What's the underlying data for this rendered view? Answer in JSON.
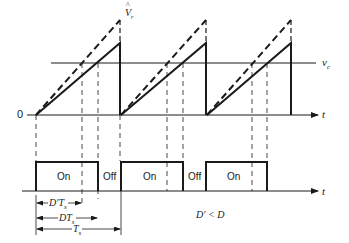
{
  "diagram": {
    "type": "pwm-waveform",
    "colors": {
      "stroke": "#1a1a1a",
      "background": "#ffffff"
    },
    "top_plot": {
      "origin_label": "0",
      "time_axis_label": "t",
      "control_voltage_label": "v_c",
      "peak_label_hat": "^",
      "peak_label": "V_r",
      "periods": 3,
      "series": [
        {
          "name": "sawtooth-solid",
          "style": "solid"
        },
        {
          "name": "sawtooth-dashed",
          "style": "dashed"
        }
      ]
    },
    "bottom_plot": {
      "time_axis_label": "t",
      "pulses": [
        {
          "label": "On"
        },
        {
          "label": "Off"
        },
        {
          "label": "On"
        },
        {
          "label": "Off"
        },
        {
          "label": "On"
        }
      ]
    },
    "dimensions": [
      {
        "name": "D-prime-Ts",
        "label_main": "D′T",
        "label_sub": "s"
      },
      {
        "name": "D-Ts",
        "label_main": "DT",
        "label_sub": "s"
      },
      {
        "name": "Ts",
        "label_main": "T",
        "label_sub": "s"
      }
    ],
    "annotation": "D′ < D"
  }
}
